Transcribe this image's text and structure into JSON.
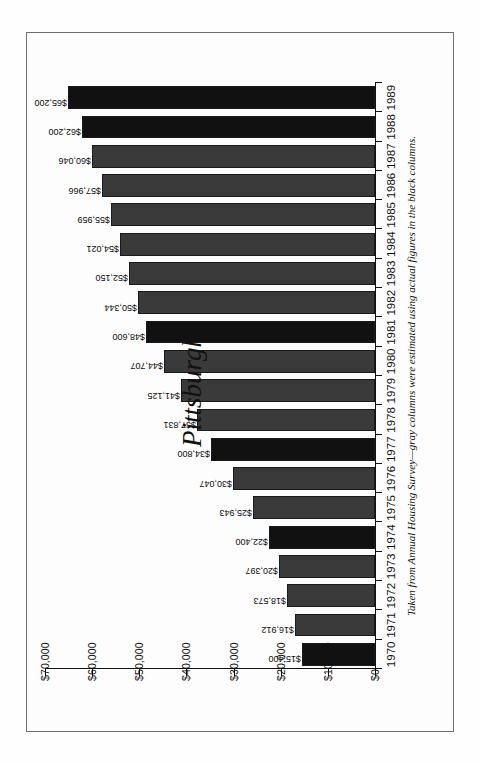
{
  "figure": {
    "title": "Pittsburgh",
    "caption": "Taken from Annual Housing Survey—gray columns were estimated using actual figures in the black columns.",
    "colors": {
      "actual_bar": "#111111",
      "estimated_bar": "#3a3a3a",
      "axis": "#111111",
      "frame": "#6f6f6f",
      "background": "#fdfdfd"
    }
  },
  "chart_data": {
    "type": "bar",
    "title": "Pittsburgh",
    "subtitle": "",
    "annotations": [
      "Taken from Annual Housing Survey—gray columns were estimated using actual figures in the black columns."
    ],
    "xlabel": "",
    "ylabel": "",
    "orientation": "vertical-rotated",
    "grid": false,
    "legend_position": "none",
    "ylim": [
      0,
      70000
    ],
    "yticks": [
      0,
      10000,
      20000,
      30000,
      40000,
      50000,
      60000,
      70000
    ],
    "ytick_labels": [
      "$0",
      "$10,000",
      "$20,000",
      "$30,000",
      "$40,000",
      "$50,000",
      "$60,000",
      "$70,000"
    ],
    "categories": [
      "1970",
      "1971",
      "1972",
      "1973",
      "1974",
      "1975",
      "1976",
      "1977",
      "1978",
      "1979",
      "1980",
      "1981",
      "1982",
      "1983",
      "1984",
      "1985",
      "1986",
      "1987",
      "1988",
      "1989"
    ],
    "values": [
      15400,
      16912,
      18573,
      20397,
      22400,
      25943,
      30047,
      34800,
      37831,
      41125,
      44707,
      48600,
      50344,
      52150,
      54021,
      55959,
      57966,
      60046,
      62200,
      65200
    ],
    "data_labels": [
      "$15,400",
      "$16,912",
      "$18,573",
      "$20,397",
      "$22,400",
      "$25,943",
      "$30,047",
      "$34,800",
      "$37,831",
      "$41,125",
      "$44,707",
      "$48,600",
      "$50,344",
      "$52,150",
      "$54,021",
      "$55,959",
      "$57,966",
      "$60,046",
      "$62,200",
      "$65,200"
    ],
    "series": [
      {
        "name": "Median home value",
        "values": [
          15400,
          16912,
          18573,
          20397,
          22400,
          25943,
          30047,
          34800,
          37831,
          41125,
          44707,
          48600,
          50344,
          52150,
          54021,
          55959,
          57966,
          60046,
          62200,
          65200
        ],
        "kinds": [
          "actual",
          "estimated",
          "estimated",
          "estimated",
          "actual",
          "estimated",
          "estimated",
          "actual",
          "estimated",
          "estimated",
          "estimated",
          "actual",
          "estimated",
          "estimated",
          "estimated",
          "estimated",
          "estimated",
          "estimated",
          "actual",
          "actual"
        ]
      }
    ]
  }
}
